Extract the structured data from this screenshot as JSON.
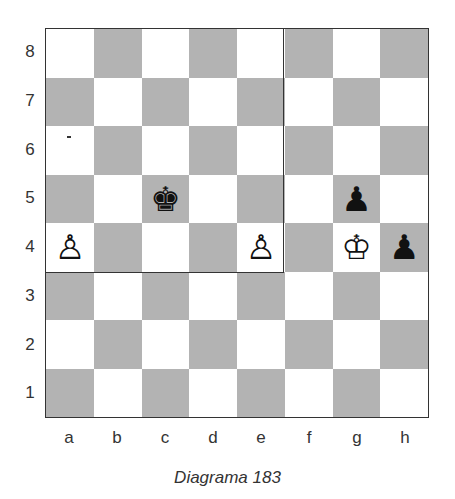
{
  "caption": "Diagrama 183",
  "ranks": [
    "8",
    "7",
    "6",
    "5",
    "4",
    "3",
    "2",
    "1"
  ],
  "files": [
    "a",
    "b",
    "c",
    "d",
    "e",
    "f",
    "g",
    "h"
  ],
  "colors": {
    "light_square": "#ffffff",
    "dark_square": "#b3b3b3"
  },
  "highlight_region": "a4-e8",
  "pieces": [
    {
      "square": "c5",
      "piece": "black-king",
      "glyph": "♚"
    },
    {
      "square": "g5",
      "piece": "black-pawn",
      "glyph": "♟"
    },
    {
      "square": "a4",
      "piece": "white-pawn",
      "glyph": "♙"
    },
    {
      "square": "e4",
      "piece": "white-pawn",
      "glyph": "♙"
    },
    {
      "square": "g4",
      "piece": "white-king",
      "glyph": "♔"
    },
    {
      "square": "h4",
      "piece": "black-pawn",
      "glyph": "♟"
    }
  ]
}
